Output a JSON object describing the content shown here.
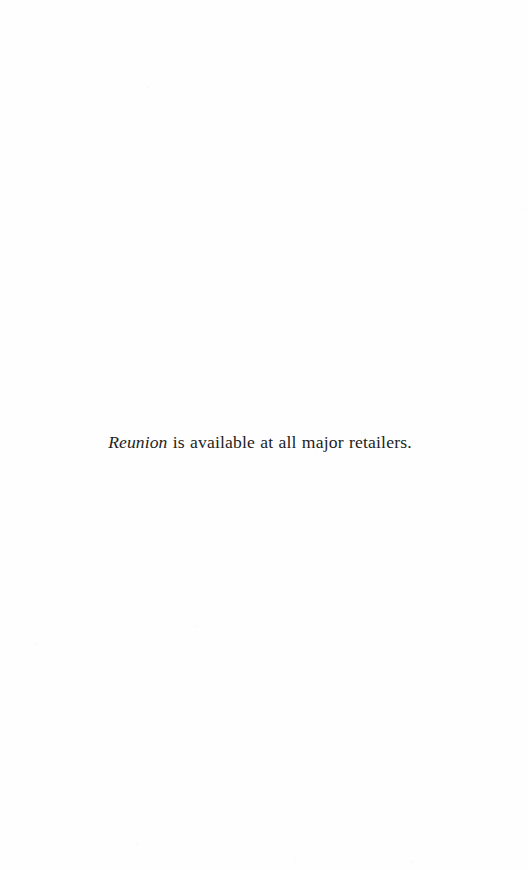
{
  "page": {
    "kind": "scanned-book-page",
    "background_color": "#fefefe",
    "ink_color": "#211d1c",
    "width": 528,
    "height": 870
  },
  "notice": {
    "book_title": "Reunion",
    "rest_of_sentence": " is available at all major retailers.",
    "full_text": "Reunion is available at all major retailers."
  }
}
